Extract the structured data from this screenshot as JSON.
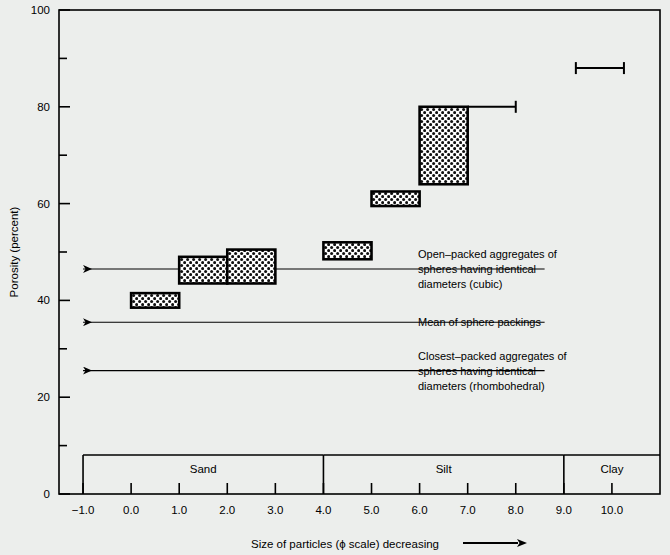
{
  "chart_data": {
    "type": "bar",
    "title": "",
    "xlabel": "Size of particles (ϕ scale) decreasing",
    "ylabel": "Porosity (percent)",
    "xlim": [
      -1.5,
      11.0
    ],
    "ylim": [
      0,
      100
    ],
    "grid": false,
    "legend": "none",
    "x_tick_labels": [
      "−1.0",
      "0.0",
      "1.0",
      "2.0",
      "3.0",
      "4.0",
      "5.0",
      "6.0",
      "7.0",
      "8.0",
      "9.0",
      "10.0"
    ],
    "x_tick_values": [
      -1.0,
      0.0,
      1.0,
      2.0,
      3.0,
      4.0,
      5.0,
      6.0,
      7.0,
      8.0,
      9.0,
      10.0
    ],
    "y_tick_labels": [
      "0",
      "20",
      "40",
      "60",
      "80",
      "100"
    ],
    "y_tick_values": [
      0,
      20,
      40,
      60,
      80,
      100
    ],
    "y_minor_ticks": [
      10,
      30,
      50,
      70,
      90
    ],
    "boxes": [
      {
        "name": "sand-fine-box",
        "x0": 0.0,
        "x1": 1.0,
        "y0": 38.5,
        "y1": 41.5
      },
      {
        "name": "sand-very-fine-box",
        "x0": 1.0,
        "x1": 2.0,
        "y0": 43.5,
        "y1": 49.0
      },
      {
        "name": "sand-coarse-silt-box",
        "x0": 2.0,
        "x1": 3.0,
        "y0": 43.5,
        "y1": 50.5
      },
      {
        "name": "silt-coarse-box",
        "x0": 4.0,
        "x1": 5.0,
        "y0": 48.5,
        "y1": 52.0
      },
      {
        "name": "silt-medium-box",
        "x0": 5.0,
        "x1": 6.0,
        "y0": 59.5,
        "y1": 62.5
      },
      {
        "name": "silt-fine-box",
        "x0": 6.0,
        "x1": 7.0,
        "y0": 64.0,
        "y1": 80.0
      }
    ],
    "error_bars": [
      {
        "name": "silt-fine-errorbar",
        "x0": 7.0,
        "x1": 8.0,
        "y": 80.0
      },
      {
        "name": "clay-errorbar",
        "x0": 9.25,
        "x1": 10.25,
        "y": 88.0
      }
    ],
    "reference_lines": [
      {
        "name": "open-packed-line",
        "y": 46.5,
        "x_from": 8.6,
        "x_to": -1.0
      },
      {
        "name": "mean-packing-line",
        "y": 35.5,
        "x_from": 8.6,
        "x_to": -1.0
      },
      {
        "name": "closest-packed-line",
        "y": 25.5,
        "x_from": 8.6,
        "x_to": -1.0
      }
    ],
    "annotations": [
      {
        "name": "open-packed-annotation",
        "y": 46.5,
        "lines": [
          "Open–packed aggregates of",
          "spheres having identical",
          "diameters (cubic)"
        ]
      },
      {
        "name": "mean-packing-annotation",
        "y": 35.5,
        "lines": [
          "Mean of sphere packings"
        ]
      },
      {
        "name": "closest-packed-annotation",
        "y": 25.5,
        "lines": [
          "Closest–packed aggregates of",
          "spheres having identical",
          "diameters (rhombohedral)"
        ]
      }
    ],
    "categories": [
      {
        "name": "category-sand",
        "label": "Sand",
        "x0": -1.0,
        "x1": 4.0
      },
      {
        "name": "category-silt",
        "label": "Silt",
        "x0": 4.0,
        "x1": 9.0
      },
      {
        "name": "category-clay",
        "label": "Clay",
        "x0": 9.0,
        "x1": 11.0
      }
    ],
    "colors": {
      "background": "#eceeec",
      "axis": "#000000",
      "box_fill": "#ffffff",
      "box_pattern": "#000000",
      "text": "#000000"
    }
  }
}
